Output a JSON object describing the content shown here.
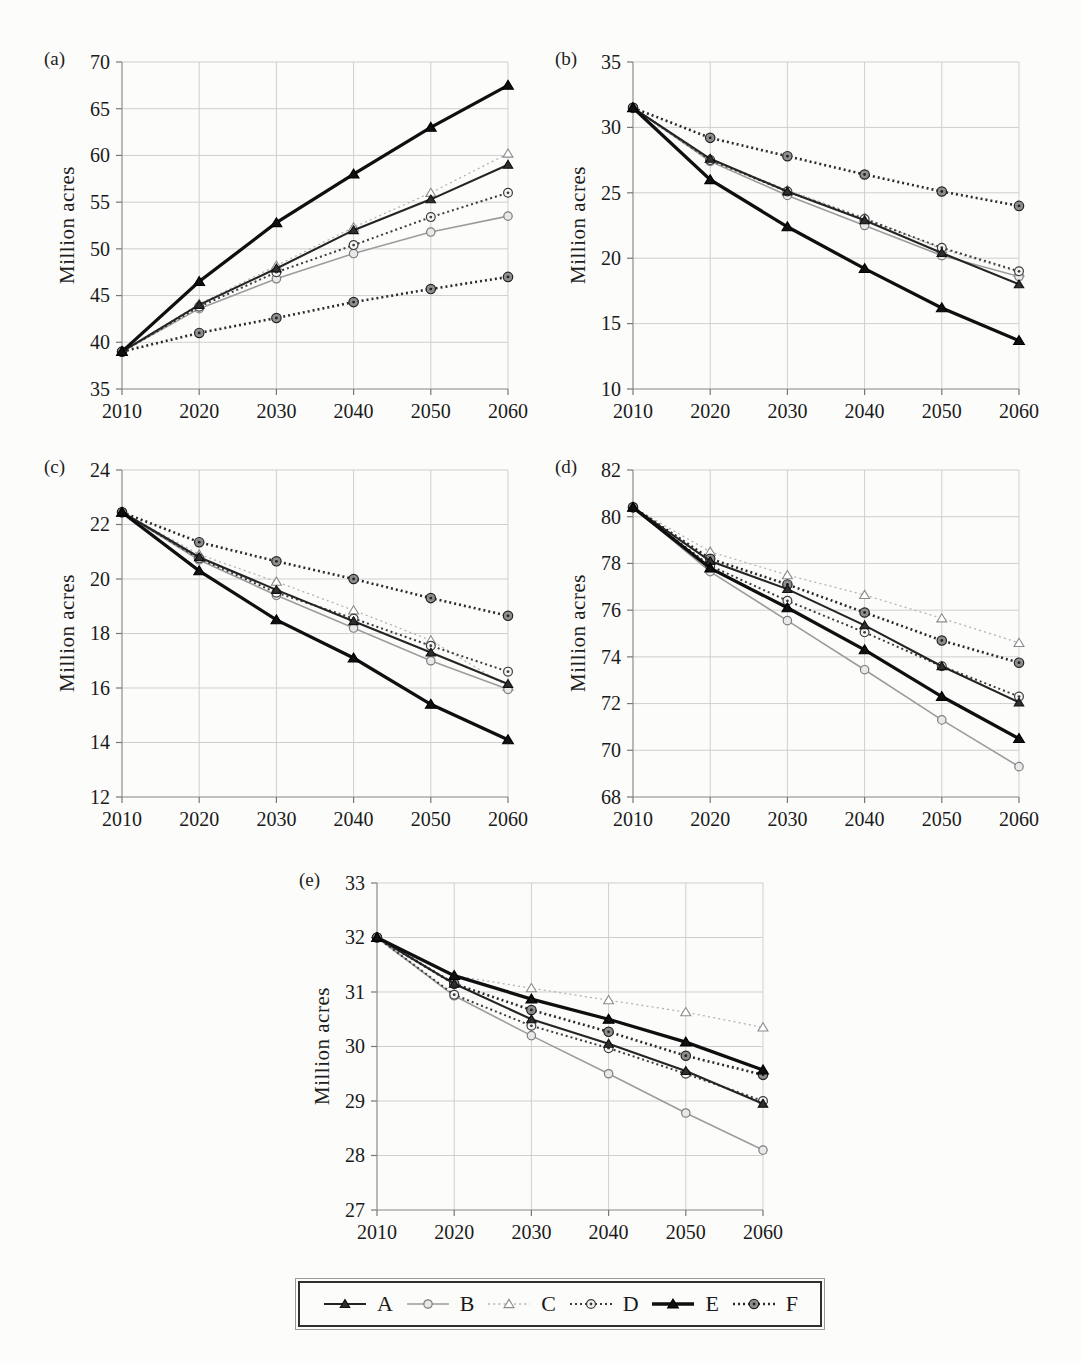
{
  "page": {
    "background": "#fcfcfa"
  },
  "axis": {
    "grid_color": "#cfcfcf",
    "axis_color": "#9b9b9b",
    "tick_color": "#777777",
    "label_color": "#1a1a1a"
  },
  "series_styles": {
    "A": {
      "color": "#242424",
      "width": 2.1,
      "dash": "",
      "marker": "triangle",
      "marker_fill": "#2e2e2e",
      "marker_stroke": "#111111",
      "marker_size": 4.4
    },
    "B": {
      "color": "#9c9c9c",
      "width": 1.6,
      "dash": "",
      "marker": "circle",
      "marker_fill": "#e8e8e8",
      "marker_stroke": "#7d7d7d",
      "marker_size": 4.2
    },
    "C": {
      "color": "#b3b3b3",
      "width": 1.3,
      "dash": "2 3.2",
      "marker": "triangle",
      "marker_fill": "#ffffff",
      "marker_stroke": "#8a8a8a",
      "marker_size": 4.6
    },
    "D": {
      "color": "#3c3c3c",
      "width": 2.0,
      "dash": "2 3",
      "marker": "circle-dot",
      "marker_fill": "#f5f5f5",
      "marker_stroke": "#3c3c3c",
      "marker_size": 4.4
    },
    "E": {
      "color": "#0f0f0f",
      "width": 3.3,
      "dash": "",
      "marker": "triangle",
      "marker_fill": "#0f0f0f",
      "marker_stroke": "#000000",
      "marker_size": 5.0
    },
    "F": {
      "color": "#2b2b2b",
      "width": 2.6,
      "dash": "2 3",
      "marker": "circle-dot",
      "marker_fill": "#8e8e8e",
      "marker_stroke": "#222222",
      "marker_size": 4.7
    }
  },
  "draw_order": [
    "C",
    "B",
    "D",
    "F",
    "A",
    "E"
  ],
  "chart_data": [
    {
      "id": "a",
      "panel_label": "(a)",
      "type": "line",
      "title": "",
      "xlabel": "",
      "ylabel": "Million acres",
      "x": [
        2010,
        2020,
        2030,
        2040,
        2050,
        2060
      ],
      "ylim": [
        35,
        70
      ],
      "ytick_step": 5,
      "grid": true,
      "series": [
        {
          "name": "A",
          "values": [
            39,
            44.0,
            47.9,
            52.0,
            55.3,
            59.0
          ]
        },
        {
          "name": "B",
          "values": [
            39,
            43.6,
            46.8,
            49.5,
            51.8,
            53.5
          ]
        },
        {
          "name": "C",
          "values": [
            39,
            44.1,
            48.2,
            52.3,
            56.0,
            60.2
          ]
        },
        {
          "name": "D",
          "values": [
            39,
            43.8,
            47.5,
            50.4,
            53.4,
            56.0
          ]
        },
        {
          "name": "E",
          "values": [
            39,
            46.5,
            52.8,
            58.0,
            63.0,
            67.5
          ]
        },
        {
          "name": "F",
          "values": [
            39,
            41.0,
            42.6,
            44.3,
            45.7,
            47.0
          ]
        }
      ]
    },
    {
      "id": "b",
      "panel_label": "(b)",
      "type": "line",
      "title": "",
      "xlabel": "",
      "ylabel": "Million acres",
      "x": [
        2010,
        2020,
        2030,
        2040,
        2050,
        2060
      ],
      "ylim": [
        10,
        35
      ],
      "ytick_step": 5,
      "grid": true,
      "series": [
        {
          "name": "A",
          "values": [
            31.5,
            27.6,
            25.1,
            22.9,
            20.4,
            18.0
          ]
        },
        {
          "name": "B",
          "values": [
            31.5,
            27.4,
            24.8,
            22.5,
            20.2,
            18.6
          ]
        },
        {
          "name": "C",
          "values": [
            31.5,
            27.6,
            25.2,
            23.1,
            20.7,
            18.9
          ]
        },
        {
          "name": "D",
          "values": [
            31.5,
            27.5,
            25.1,
            23.0,
            20.8,
            19.0
          ]
        },
        {
          "name": "E",
          "values": [
            31.5,
            26.0,
            22.4,
            19.2,
            16.2,
            13.7
          ]
        },
        {
          "name": "F",
          "values": [
            31.5,
            29.2,
            27.8,
            26.4,
            25.1,
            24.0
          ]
        }
      ]
    },
    {
      "id": "c",
      "panel_label": "(c)",
      "type": "line",
      "title": "",
      "xlabel": "",
      "ylabel": "Million acres",
      "x": [
        2010,
        2020,
        2030,
        2040,
        2050,
        2060
      ],
      "ylim": [
        12,
        24
      ],
      "ytick_step": 2,
      "grid": true,
      "series": [
        {
          "name": "A",
          "values": [
            22.45,
            20.8,
            19.6,
            18.45,
            17.3,
            16.15
          ]
        },
        {
          "name": "B",
          "values": [
            22.45,
            20.7,
            19.4,
            18.2,
            17.0,
            15.95
          ]
        },
        {
          "name": "C",
          "values": [
            22.45,
            20.9,
            19.9,
            18.85,
            17.75,
            16.05
          ]
        },
        {
          "name": "D",
          "values": [
            22.45,
            20.75,
            19.5,
            18.55,
            17.55,
            16.6
          ]
        },
        {
          "name": "E",
          "values": [
            22.45,
            20.3,
            18.5,
            17.1,
            15.4,
            14.1
          ]
        },
        {
          "name": "F",
          "values": [
            22.45,
            21.35,
            20.65,
            20.0,
            19.3,
            18.65
          ]
        }
      ]
    },
    {
      "id": "d",
      "panel_label": "(d)",
      "type": "line",
      "title": "",
      "xlabel": "",
      "ylabel": "Million acres",
      "x": [
        2010,
        2020,
        2030,
        2040,
        2050,
        2060
      ],
      "ylim": [
        68,
        82
      ],
      "ytick_step": 2,
      "grid": true,
      "series": [
        {
          "name": "A",
          "values": [
            80.4,
            78.1,
            76.9,
            75.35,
            73.6,
            72.05
          ]
        },
        {
          "name": "B",
          "values": [
            80.4,
            77.65,
            75.55,
            73.45,
            71.3,
            69.3
          ]
        },
        {
          "name": "C",
          "values": [
            80.4,
            78.5,
            77.5,
            76.65,
            75.65,
            74.6
          ]
        },
        {
          "name": "D",
          "values": [
            80.4,
            77.9,
            76.4,
            75.05,
            73.6,
            72.3
          ]
        },
        {
          "name": "E",
          "values": [
            80.4,
            77.8,
            76.1,
            74.3,
            72.3,
            70.5
          ]
        },
        {
          "name": "F",
          "values": [
            80.4,
            78.2,
            77.1,
            75.9,
            74.7,
            73.75
          ]
        }
      ]
    },
    {
      "id": "e",
      "panel_label": "(e)",
      "type": "line",
      "title": "",
      "xlabel": "",
      "ylabel": "Million acres",
      "x": [
        2010,
        2020,
        2030,
        2040,
        2050,
        2060
      ],
      "ylim": [
        27,
        33
      ],
      "ytick_step": 1,
      "grid": true,
      "series": [
        {
          "name": "A",
          "values": [
            32,
            31.15,
            30.5,
            30.05,
            29.55,
            28.95
          ]
        },
        {
          "name": "B",
          "values": [
            32,
            30.93,
            30.2,
            29.5,
            28.78,
            28.1
          ]
        },
        {
          "name": "C",
          "values": [
            32,
            31.3,
            31.07,
            30.85,
            30.63,
            30.35
          ]
        },
        {
          "name": "D",
          "values": [
            32,
            30.95,
            30.38,
            29.97,
            29.5,
            29.0
          ]
        },
        {
          "name": "E",
          "values": [
            32,
            31.3,
            30.87,
            30.5,
            30.08,
            29.57
          ]
        },
        {
          "name": "F",
          "values": [
            32,
            31.15,
            30.67,
            30.27,
            29.83,
            29.48
          ]
        }
      ]
    }
  ],
  "legend": {
    "entries": [
      "A",
      "B",
      "C",
      "D",
      "E",
      "F"
    ],
    "position": "bottom-center"
  }
}
